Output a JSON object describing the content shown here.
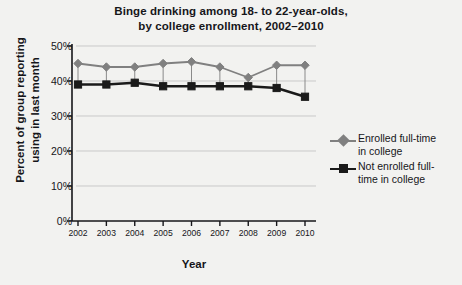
{
  "chart_data": {
    "type": "line",
    "title": "Binge drinking among 18- to 22-year-olds, by college enrollment, 2002–2010",
    "title_line1": "Binge drinking among 18- to 22-year-olds,",
    "title_line2": "by college enrollment, 2002–2010",
    "xlabel": "Year",
    "ylabel": "Percent of group reporting using in last month",
    "ylabel_line1": "Percent of group reporting",
    "ylabel_line2": "using in last month",
    "categories": [
      "2002",
      "2003",
      "2004",
      "2005",
      "2006",
      "2007",
      "2008",
      "2009",
      "2010"
    ],
    "ylim": [
      0,
      50
    ],
    "yticks": [
      "0%",
      "10%",
      "20%",
      "30%",
      "40%",
      "50%"
    ],
    "ytick_values": [
      0,
      10,
      20,
      30,
      40,
      50
    ],
    "grid": true,
    "legend_position": "right",
    "series": [
      {
        "name": "Enrolled full-time in college",
        "name_line1": "Enrolled full-time",
        "name_line2": "in college",
        "color": "#808080",
        "marker": "diamond",
        "values": [
          45,
          44,
          44,
          45,
          45.5,
          44,
          41,
          44.5,
          44.5
        ]
      },
      {
        "name": "Not enrolled full-time in college",
        "name_line1": "Not enrolled full-",
        "name_line2": "time in college",
        "color": "#1a1a1a",
        "marker": "square",
        "values": [
          39,
          39,
          39.5,
          38.5,
          38.5,
          38.5,
          38.5,
          38,
          35.5
        ]
      }
    ]
  },
  "colors": {
    "background": "#f2f2f0",
    "axis": "#16161a",
    "grid": "#c9c9c9",
    "series_enrolled": "#808080",
    "series_not_enrolled": "#1a1a1a"
  }
}
